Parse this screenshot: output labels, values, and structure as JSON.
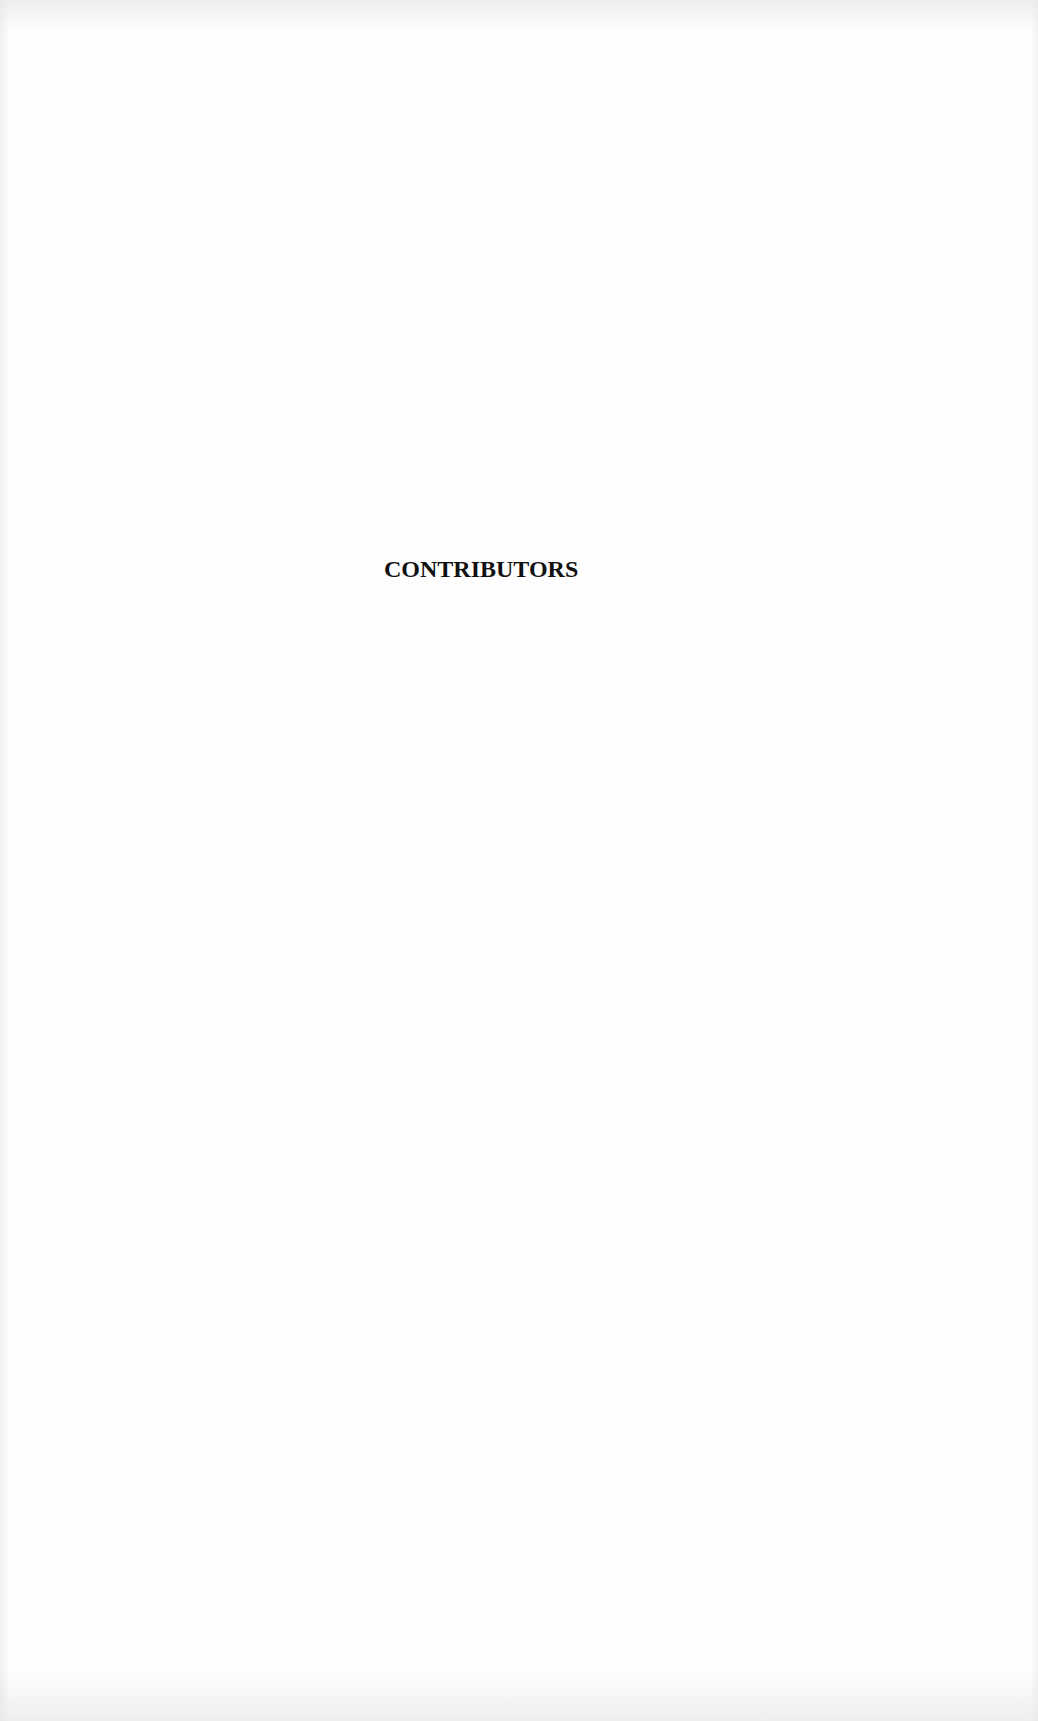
{
  "page": {
    "heading": "CONTRIBUTORS"
  }
}
